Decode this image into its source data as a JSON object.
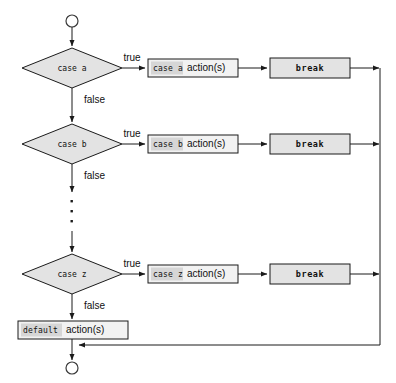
{
  "diagram": {
    "type": "flowchart",
    "start_node": {
      "shape": "circle",
      "label": ""
    },
    "end_node": {
      "shape": "circle",
      "label": ""
    },
    "edge_labels": {
      "true": "true",
      "false": "false"
    },
    "ellipsis": "⋮",
    "colors": {
      "shape_fill": "#e3e3e3",
      "box_fill": "#f2f2f2",
      "keyword_highlight": "#d6d6d6",
      "stroke": "#1a1a1a",
      "background": "#ffffff"
    },
    "rows": [
      {
        "id": "case-a",
        "decision": {
          "keyword": "case",
          "operand": "a"
        },
        "decision_text": "case a",
        "true_label": "true",
        "false_label": "false",
        "action": {
          "keyword": "case a",
          "rest": "action(s)"
        },
        "action_text": "case a action(s)",
        "break_text": "break"
      },
      {
        "id": "case-b",
        "decision": {
          "keyword": "case",
          "operand": "b"
        },
        "decision_text": "case b",
        "true_label": "true",
        "false_label": "false",
        "action": {
          "keyword": "case b",
          "rest": "action(s)"
        },
        "action_text": "case b action(s)",
        "break_text": "break"
      },
      {
        "id": "case-z",
        "decision": {
          "keyword": "case",
          "operand": "z"
        },
        "decision_text": "case z",
        "true_label": "true",
        "false_label": "false",
        "action": {
          "keyword": "case z",
          "rest": "action(s)"
        },
        "action_text": "case z action(s)",
        "break_text": "break"
      }
    ],
    "default_node": {
      "keyword": "default",
      "rest": "action(s)",
      "text": "default action(s)"
    }
  }
}
